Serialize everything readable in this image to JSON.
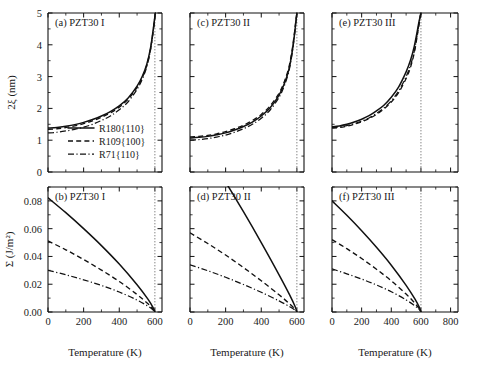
{
  "figure": {
    "xaxis_label": "Temperature (K)",
    "yaxis_label_top": "2ξ (nm)",
    "yaxis_label_bottom": "Σ (J/m²)"
  },
  "legend": {
    "items": [
      {
        "label": "R180{110}",
        "style": "solid"
      },
      {
        "label": "R109{100}",
        "style": "dashed"
      },
      {
        "label": "R71{110}",
        "style": "dashdot"
      }
    ]
  },
  "ticks": {
    "x_left": [
      "0",
      "200",
      "400",
      "600"
    ],
    "x_mid": [
      "0",
      "200",
      "400",
      "600"
    ],
    "x_right": [
      "0",
      "200",
      "400",
      "600",
      "800"
    ],
    "y_top": [
      "0",
      "1",
      "2",
      "3",
      "4",
      "5"
    ],
    "y_bottom": [
      "0.00",
      "0.02",
      "0.04",
      "0.06",
      "0.08"
    ]
  },
  "chart_data": [
    {
      "type": "line",
      "panel": "a",
      "title": "(a) PZT30 I",
      "xlabel": "Temperature (K)",
      "ylabel": "2ξ (nm)",
      "xlim": [
        0,
        640
      ],
      "ylim": [
        0,
        5
      ],
      "curie_temperature": 600,
      "grid": false,
      "legend_position": "lower-center",
      "series": [
        {
          "name": "R180{110}",
          "style": "solid",
          "x": [
            0,
            50,
            100,
            150,
            200,
            250,
            300,
            350,
            400,
            450,
            500,
            530,
            555,
            575,
            590,
            598,
            603
          ],
          "y": [
            1.38,
            1.4,
            1.44,
            1.49,
            1.56,
            1.65,
            1.76,
            1.9,
            2.08,
            2.33,
            2.7,
            3.02,
            3.4,
            3.88,
            4.45,
            4.8,
            5.0
          ]
        },
        {
          "name": "R109{100}",
          "style": "dashed",
          "x": [
            0,
            50,
            100,
            150,
            200,
            250,
            300,
            350,
            400,
            450,
            500,
            530,
            555,
            575,
            590,
            598,
            603
          ],
          "y": [
            1.34,
            1.36,
            1.4,
            1.45,
            1.52,
            1.61,
            1.72,
            1.86,
            2.04,
            2.29,
            2.66,
            2.98,
            3.36,
            3.85,
            4.42,
            4.78,
            5.0
          ]
        },
        {
          "name": "R71{110}",
          "style": "dashdot",
          "x": [
            0,
            50,
            100,
            150,
            200,
            250,
            300,
            350,
            400,
            450,
            500,
            530,
            555,
            575,
            590,
            598,
            603
          ],
          "y": [
            1.23,
            1.25,
            1.29,
            1.34,
            1.41,
            1.5,
            1.62,
            1.76,
            1.96,
            2.21,
            2.6,
            2.93,
            3.32,
            3.82,
            4.4,
            4.76,
            5.0
          ]
        }
      ]
    },
    {
      "type": "line",
      "panel": "b",
      "title": "(b) PZT30 I",
      "xlabel": "Temperature (K)",
      "ylabel": "Σ (J/m²)",
      "xlim": [
        0,
        640
      ],
      "ylim": [
        0,
        0.09
      ],
      "curie_temperature": 600,
      "grid": false,
      "series": [
        {
          "name": "R180{110}",
          "style": "solid",
          "x": [
            0,
            100,
            200,
            300,
            400,
            500,
            560,
            590,
            600
          ],
          "y": [
            0.0822,
            0.0715,
            0.06,
            0.0478,
            0.0345,
            0.0196,
            0.0094,
            0.0032,
            0.0
          ]
        },
        {
          "name": "R109{100}",
          "style": "dashed",
          "x": [
            0,
            100,
            200,
            300,
            400,
            500,
            560,
            590,
            600
          ],
          "y": [
            0.0512,
            0.0448,
            0.0378,
            0.0302,
            0.022,
            0.0126,
            0.0061,
            0.0021,
            0.0
          ]
        },
        {
          "name": "R71{110}",
          "style": "dashdot",
          "x": [
            0,
            100,
            200,
            300,
            400,
            500,
            560,
            590,
            600
          ],
          "y": [
            0.03,
            0.0268,
            0.0232,
            0.0191,
            0.0144,
            0.0086,
            0.0043,
            0.0015,
            0.0
          ]
        }
      ]
    },
    {
      "type": "line",
      "panel": "c",
      "title": "(c) PZT30 II",
      "xlabel": "Temperature (K)",
      "ylabel": "2ξ (nm)",
      "xlim": [
        0,
        640
      ],
      "ylim": [
        0,
        5
      ],
      "curie_temperature": 600,
      "grid": false,
      "series": [
        {
          "name": "R180{110}",
          "style": "solid",
          "x": [
            0,
            50,
            100,
            150,
            200,
            250,
            300,
            350,
            400,
            450,
            500,
            530,
            555,
            572,
            585,
            595,
            600
          ],
          "y": [
            1.07,
            1.09,
            1.12,
            1.17,
            1.23,
            1.32,
            1.43,
            1.57,
            1.76,
            2.02,
            2.42,
            2.78,
            3.22,
            3.72,
            4.25,
            4.75,
            5.0
          ]
        },
        {
          "name": "R109{100}",
          "style": "dashed",
          "x": [
            0,
            50,
            100,
            150,
            200,
            250,
            300,
            350,
            400,
            450,
            500,
            530,
            555,
            572,
            585,
            595,
            600
          ],
          "y": [
            1.1,
            1.12,
            1.15,
            1.2,
            1.27,
            1.36,
            1.47,
            1.62,
            1.81,
            2.08,
            2.48,
            2.85,
            3.29,
            3.79,
            4.31,
            4.79,
            5.0
          ]
        },
        {
          "name": "R71{110}",
          "style": "dashdot",
          "x": [
            0,
            50,
            100,
            150,
            200,
            250,
            300,
            350,
            400,
            450,
            500,
            530,
            555,
            572,
            585,
            595,
            600
          ],
          "y": [
            1.0,
            1.02,
            1.05,
            1.1,
            1.16,
            1.25,
            1.36,
            1.5,
            1.69,
            1.95,
            2.35,
            2.72,
            3.17,
            3.68,
            4.22,
            4.73,
            5.0
          ]
        }
      ]
    },
    {
      "type": "line",
      "panel": "d",
      "title": "(d) PZT30 II",
      "xlabel": "Temperature (K)",
      "ylabel": "Σ (J/m²)",
      "xlim": [
        0,
        640
      ],
      "ylim": [
        0,
        0.09
      ],
      "curie_temperature": 600,
      "grid": false,
      "note": "solid curve rises above plotted range",
      "series": [
        {
          "name": "R180{110}",
          "style": "solid",
          "x": [
            0,
            100,
            200,
            300,
            400,
            500,
            560,
            590,
            600
          ],
          "y": [
            0.132,
            0.1132,
            0.0935,
            0.0722,
            0.05,
            0.0268,
            0.0122,
            0.004,
            0.0
          ]
        },
        {
          "name": "R109{100}",
          "style": "dashed",
          "x": [
            0,
            100,
            200,
            300,
            400,
            500,
            560,
            590,
            600
          ],
          "y": [
            0.057,
            0.0493,
            0.041,
            0.032,
            0.0225,
            0.0124,
            0.0058,
            0.0019,
            0.0
          ]
        },
        {
          "name": "R71{110}",
          "style": "dashdot",
          "x": [
            0,
            100,
            200,
            300,
            400,
            500,
            560,
            590,
            600
          ],
          "y": [
            0.034,
            0.0297,
            0.025,
            0.0198,
            0.0142,
            0.008,
            0.0038,
            0.0013,
            0.0
          ]
        }
      ]
    },
    {
      "type": "line",
      "panel": "e",
      "title": "(e) PZT30 III",
      "xlabel": "Temperature (K)",
      "ylabel": "2ξ (nm)",
      "xlim": [
        0,
        850
      ],
      "ylim": [
        0,
        5
      ],
      "curie_temperature": 600,
      "grid": false,
      "series": [
        {
          "name": "R180{110}",
          "style": "solid",
          "x": [
            0,
            50,
            100,
            150,
            200,
            250,
            300,
            350,
            400,
            450,
            500,
            530,
            555,
            572,
            585,
            595,
            600
          ],
          "y": [
            1.42,
            1.45,
            1.5,
            1.57,
            1.66,
            1.77,
            1.92,
            2.1,
            2.35,
            2.68,
            3.15,
            3.52,
            3.95,
            4.35,
            4.68,
            4.9,
            5.0
          ]
        },
        {
          "name": "R109{100}",
          "style": "dashed",
          "x": [
            0,
            50,
            100,
            150,
            200,
            250,
            300,
            350,
            400,
            450,
            500,
            530,
            555,
            572,
            585,
            595,
            600
          ],
          "y": [
            1.38,
            1.4,
            1.44,
            1.5,
            1.58,
            1.68,
            1.81,
            1.98,
            2.2,
            2.5,
            2.94,
            3.3,
            3.75,
            4.2,
            4.58,
            4.86,
            5.0
          ]
        },
        {
          "name": "R71{110}",
          "style": "dashdot",
          "x": [
            0,
            50,
            100,
            150,
            200,
            250,
            300,
            350,
            400,
            450,
            500,
            530,
            555,
            572,
            585,
            595,
            600
          ],
          "y": [
            1.4,
            1.42,
            1.46,
            1.52,
            1.6,
            1.7,
            1.84,
            2.01,
            2.24,
            2.55,
            3.0,
            3.36,
            3.8,
            4.24,
            4.61,
            4.88,
            5.0
          ]
        }
      ]
    },
    {
      "type": "line",
      "panel": "f",
      "title": "(f) PZT30 III",
      "xlabel": "Temperature (K)",
      "ylabel": "Σ (J/m²)",
      "xlim": [
        0,
        850
      ],
      "ylim": [
        0,
        0.09
      ],
      "curie_temperature": 600,
      "grid": false,
      "series": [
        {
          "name": "R180{110}",
          "style": "solid",
          "x": [
            0,
            100,
            200,
            300,
            400,
            500,
            560,
            590,
            600
          ],
          "y": [
            0.08,
            0.0696,
            0.0585,
            0.0466,
            0.0337,
            0.0192,
            0.0092,
            0.0031,
            0.0
          ]
        },
        {
          "name": "R109{100}",
          "style": "dashed",
          "x": [
            0,
            100,
            200,
            300,
            400,
            500,
            560,
            590,
            600
          ],
          "y": [
            0.0521,
            0.0456,
            0.0385,
            0.0308,
            0.0224,
            0.0129,
            0.0062,
            0.0021,
            0.0
          ]
        },
        {
          "name": "R71{110}",
          "style": "dashdot",
          "x": [
            0,
            100,
            200,
            300,
            400,
            500,
            560,
            590,
            600
          ],
          "y": [
            0.031,
            0.0275,
            0.0237,
            0.0195,
            0.0146,
            0.0087,
            0.0043,
            0.0015,
            0.0
          ]
        }
      ]
    }
  ]
}
